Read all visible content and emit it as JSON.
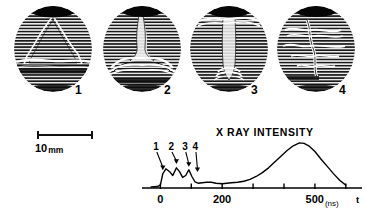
{
  "figure": {
    "frames": [
      {
        "label": "1",
        "caption_position": "below-right"
      },
      {
        "label": "2",
        "caption_position": "below-right"
      },
      {
        "label": "3",
        "caption_position": "below-right"
      },
      {
        "label": "4",
        "caption_position": "below-right"
      }
    ],
    "scalebar": {
      "value": "10",
      "unit": "mm"
    }
  },
  "chart_data": {
    "type": "line",
    "title": "X RAY INTENSITY",
    "xlabel": "t",
    "xunit": "(ns)",
    "ylabel": "",
    "xlim": [
      -40,
      620
    ],
    "ylim": [
      0,
      1.0
    ],
    "grid": false,
    "legend": null,
    "xticks": [
      0,
      100,
      200,
      300,
      400,
      500,
      600
    ],
    "xtick_labels": [
      "0",
      "",
      "200",
      "",
      "",
      "500",
      ""
    ],
    "annotations": [
      {
        "label": "1",
        "x": 8,
        "y": 0.34
      },
      {
        "label": "2",
        "x": 52,
        "y": 0.47
      },
      {
        "label": "3",
        "x": 92,
        "y": 0.41
      },
      {
        "label": "4",
        "x": 120,
        "y": 0.3
      }
    ],
    "x": [
      -30,
      -10,
      0,
      8,
      18,
      30,
      40,
      52,
      62,
      72,
      82,
      92,
      102,
      112,
      122,
      135,
      150,
      165,
      180,
      200,
      215,
      230,
      250,
      270,
      290,
      310,
      330,
      350,
      370,
      390,
      410,
      430,
      450,
      465,
      480,
      500,
      520,
      540,
      560,
      580,
      600
    ],
    "y": [
      0.02,
      0.03,
      0.06,
      0.3,
      0.4,
      0.34,
      0.26,
      0.42,
      0.34,
      0.22,
      0.26,
      0.38,
      0.24,
      0.13,
      0.1,
      0.11,
      0.12,
      0.12,
      0.1,
      0.09,
      0.1,
      0.11,
      0.12,
      0.14,
      0.18,
      0.24,
      0.32,
      0.42,
      0.54,
      0.66,
      0.78,
      0.88,
      0.94,
      0.93,
      0.88,
      0.76,
      0.6,
      0.45,
      0.3,
      0.16,
      0.06
    ]
  }
}
